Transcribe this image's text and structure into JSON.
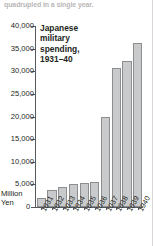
{
  "page": {
    "caption_bleed": "quadrupled in a single year."
  },
  "chart_data": {
    "type": "bar",
    "title": "Japanese military spending, 1931–40",
    "xlabel": "",
    "ylabel": "Million Yen",
    "unit_label_line1": "Million",
    "unit_label_line2": "Yen",
    "zero_label": "0",
    "categories": [
      "1931",
      "1932",
      "1933",
      "1934",
      "1935",
      "1936",
      "1937",
      "1938",
      "1939",
      "1940"
    ],
    "values": [
      2000,
      3700,
      4500,
      5000,
      5300,
      5600,
      20000,
      30800,
      32300,
      36200
    ],
    "ylim": [
      0,
      40000
    ],
    "yticks": [
      0,
      5000,
      10000,
      15000,
      20000,
      25000,
      30000,
      35000,
      40000
    ],
    "ytick_labels": [
      "0",
      "5,000",
      "10,000",
      "15,000",
      "20,000",
      "25,000",
      "30,000",
      "35,000",
      "40,000"
    ],
    "grid": false,
    "legend": "none",
    "bar_color": "#c9cacb",
    "bar_edge_color": "#8d8e90",
    "axis_color": "#58595b",
    "text_color": "#231f20"
  }
}
